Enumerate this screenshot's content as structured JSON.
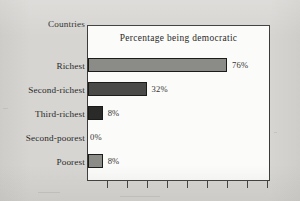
{
  "chart_data": {
    "type": "bar",
    "orientation": "horizontal",
    "title": "Percentage being democratic",
    "axis_title": "Countries",
    "xlabel": "",
    "ylabel": "Countries",
    "categories": [
      "Richest",
      "Second-richest",
      "Third-richest",
      "Second-poorest",
      "Poorest"
    ],
    "values": [
      76,
      32,
      8,
      0,
      8
    ],
    "value_labels": [
      "76%",
      "32%",
      "8%",
      "0%",
      "8%"
    ],
    "xlim": [
      0,
      100
    ],
    "grid": false,
    "legend": false,
    "x_tick_count": 9,
    "x_tick_labels": [],
    "bar_colors": [
      "#8b8b88",
      "#4a4a48",
      "#2a2a28",
      "#8b8b88",
      "#8b8b88"
    ]
  },
  "labels": {
    "axis_title": "Countries",
    "title": "Percentage being democratic",
    "categories": [
      {
        "name": "Richest",
        "value_label": "76%"
      },
      {
        "name": "Second-richest",
        "value_label": "32%"
      },
      {
        "name": "Third-richest",
        "value_label": "8%"
      },
      {
        "name": "Second-poorest",
        "value_label": "0%"
      },
      {
        "name": "Poorest",
        "value_label": "8%"
      }
    ]
  },
  "colors": {
    "page_background": "#d6d5d2",
    "plot_background": "#fbfbfa",
    "frame": "#3a3a38",
    "text": "#2a2a28",
    "bar_light": "#8b8b88",
    "bar_mid": "#4a4a48",
    "bar_dark": "#2a2a28"
  }
}
